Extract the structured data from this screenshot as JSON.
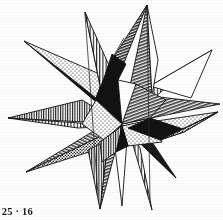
{
  "figure": {
    "caption": "e 25 · 16",
    "background_color": "#fdfdfd",
    "ink_color": "#111111",
    "media": "scanned halftone book illustration"
  },
  "palette": {
    "black": "#121212",
    "white": "#ffffff",
    "paper": "#fdfdfd",
    "gray_mid": "#8e8e8e",
    "gray_light": "#c9c9c9",
    "stroke": "#111111"
  },
  "illustration": {
    "type": "stellated-polyhedron",
    "center": {
      "x": 120,
      "y": 125
    },
    "spike_count": 12,
    "fill_patterns": [
      "solid-black",
      "solid-white",
      "vertical-hatch",
      "diagonal-hatch",
      "stipple-light",
      "stipple-dark"
    ],
    "spikes": [
      {
        "name": "spike-top-left-vertical",
        "tip_x": 85,
        "tip_y": 12,
        "fill": "vertical-hatch"
      },
      {
        "name": "spike-top-right-diagonal",
        "tip_x": 147,
        "tip_y": 5,
        "fill": "diagonal-hatch"
      },
      {
        "name": "spike-upper-right-vertical",
        "tip_x": 212,
        "tip_y": 50,
        "fill": "vertical-hatch"
      },
      {
        "name": "spike-right-gray",
        "tip_x": 220,
        "tip_y": 104,
        "fill": "diagonal-hatch"
      },
      {
        "name": "spike-right-stipple",
        "tip_x": 218,
        "tip_y": 112,
        "fill": "stipple-light"
      },
      {
        "name": "spike-lower-right-black",
        "tip_x": 176,
        "tip_y": 178,
        "fill": "solid-black"
      },
      {
        "name": "spike-bottom-right-vertical",
        "tip_x": 152,
        "tip_y": 210,
        "fill": "vertical-hatch"
      },
      {
        "name": "spike-bottom-white",
        "tip_x": 122,
        "tip_y": 206,
        "fill": "solid-white"
      },
      {
        "name": "spike-bottom-left-diagonal",
        "tip_x": 100,
        "tip_y": 209,
        "fill": "diagonal-hatch"
      },
      {
        "name": "spike-lower-left-gray",
        "tip_x": 26,
        "tip_y": 172,
        "fill": "diagonal-hatch"
      },
      {
        "name": "spike-left-vertical",
        "tip_x": 8,
        "tip_y": 118,
        "fill": "vertical-hatch"
      },
      {
        "name": "spike-upper-left-black",
        "tip_x": 24,
        "tip_y": 41,
        "fill": "solid-black"
      }
    ]
  }
}
